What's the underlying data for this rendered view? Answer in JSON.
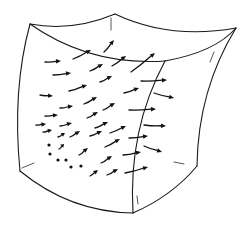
{
  "figure": {
    "title": "",
    "colors": {
      "background": "#ffffff",
      "ink": "#111111"
    }
  },
  "cube": {
    "vertices": {
      "top_left": [
        30,
        24
      ],
      "top_back": [
        115,
        14
      ],
      "top_right": [
        236,
        28
      ],
      "front_top": [
        165,
        61
      ],
      "bottom_left": [
        20,
        171
      ],
      "bottom_front": [
        133,
        213
      ],
      "bottom_right": [
        197,
        166
      ]
    },
    "edges": [
      {
        "name": "top-left-to-top-back",
        "d": "M30,24 Q72,32 115,14"
      },
      {
        "name": "top-back-to-top-right",
        "d": "M115,14 Q170,40 236,28"
      },
      {
        "name": "top-left-to-front-top",
        "d": "M30,24 Q90,66 165,61"
      },
      {
        "name": "front-top-to-top-right",
        "d": "M165,61 Q215,52 236,28"
      },
      {
        "name": "left-vertical",
        "d": "M30,24 Q12,90 20,171"
      },
      {
        "name": "front-vertical",
        "d": "M165,61 Q128,130 133,213"
      },
      {
        "name": "right-vertical",
        "d": "M236,28 Q198,90 197,166"
      },
      {
        "name": "bottom-left-to-bottom-front",
        "d": "M20,171 Q70,212 133,213"
      },
      {
        "name": "bottom-front-to-bottom-right",
        "d": "M133,213 Q172,196 197,166"
      }
    ],
    "hidden_edges": [
      {
        "name": "hidden-back-top",
        "d": "M111,18 L111,30"
      },
      {
        "name": "hidden-bottom-left",
        "d": "M22,168 L34,163"
      },
      {
        "name": "hidden-bottom-right",
        "d": "M174,162 L184,164"
      },
      {
        "name": "hidden-front-bottom",
        "d": "M137,196 L138,204"
      },
      {
        "name": "hidden-right-top",
        "d": "M214,52 L210,62"
      }
    ]
  },
  "vector_field": {
    "arrows": [
      {
        "from": [
          45,
          62
        ],
        "to": [
          61,
          61
        ]
      },
      {
        "from": [
          53,
          75
        ],
        "to": [
          71,
          73
        ]
      },
      {
        "from": [
          73,
          59
        ],
        "to": [
          91,
          50
        ]
      },
      {
        "from": [
          90,
          71
        ],
        "to": [
          103,
          64
        ]
      },
      {
        "from": [
          104,
          52
        ],
        "to": [
          114,
          40
        ]
      },
      {
        "from": [
          112,
          66
        ],
        "to": [
          126,
          56
        ]
      },
      {
        "from": [
          131,
          72
        ],
        "to": [
          155,
          53
        ]
      },
      {
        "from": [
          40,
          95
        ],
        "to": [
          53,
          96
        ]
      },
      {
        "from": [
          69,
          91
        ],
        "to": [
          87,
          85
        ]
      },
      {
        "from": [
          100,
          82
        ],
        "to": [
          112,
          76
        ]
      },
      {
        "from": [
          141,
          81
        ],
        "to": [
          167,
          80
        ]
      },
      {
        "from": [
          154,
          93
        ],
        "to": [
          174,
          98
        ]
      },
      {
        "from": [
          60,
          108
        ],
        "to": [
          73,
          106
        ]
      },
      {
        "from": [
          84,
          104
        ],
        "to": [
          97,
          97
        ]
      },
      {
        "from": [
          103,
          110
        ],
        "to": [
          115,
          103
        ]
      },
      {
        "from": [
          124,
          93
        ],
        "to": [
          139,
          88
        ]
      },
      {
        "from": [
          129,
          110
        ],
        "to": [
          156,
          109
        ]
      },
      {
        "from": [
          45,
          116
        ],
        "to": [
          58,
          115
        ]
      },
      {
        "from": [
          36,
          125
        ],
        "to": [
          46,
          124
        ]
      },
      {
        "from": [
          60,
          126
        ],
        "to": [
          72,
          123
        ]
      },
      {
        "from": [
          87,
          118
        ],
        "to": [
          98,
          112
        ]
      },
      {
        "from": [
          95,
          128
        ],
        "to": [
          108,
          122
        ]
      },
      {
        "from": [
          110,
          133
        ],
        "to": [
          126,
          126
        ]
      },
      {
        "from": [
          144,
          125
        ],
        "to": [
          166,
          126
        ]
      },
      {
        "from": [
          43,
          132
        ],
        "to": [
          52,
          130
        ]
      },
      {
        "from": [
          58,
          137
        ],
        "to": [
          65,
          133
        ]
      },
      {
        "from": [
          70,
          137
        ],
        "to": [
          80,
          131
        ]
      },
      {
        "from": [
          90,
          136
        ],
        "to": [
          102,
          131
        ]
      },
      {
        "from": [
          105,
          147
        ],
        "to": [
          120,
          139
        ]
      },
      {
        "from": [
          129,
          138
        ],
        "to": [
          148,
          136
        ]
      },
      {
        "from": [
          144,
          146
        ],
        "to": [
          162,
          152
        ]
      },
      {
        "from": [
          123,
          155
        ],
        "to": [
          141,
          152
        ]
      },
      {
        "from": [
          79,
          155
        ],
        "to": [
          88,
          148
        ]
      },
      {
        "from": [
          59,
          149
        ],
        "to": [
          64,
          144
        ]
      },
      {
        "from": [
          101,
          163
        ],
        "to": [
          112,
          156
        ]
      },
      {
        "from": [
          90,
          176
        ],
        "to": [
          98,
          170
        ]
      },
      {
        "from": [
          107,
          175
        ],
        "to": [
          118,
          169
        ]
      },
      {
        "from": [
          125,
          173
        ],
        "to": [
          148,
          167
        ]
      }
    ],
    "dots": [
      [
        49,
        145
      ],
      [
        50,
        154
      ],
      [
        58,
        160
      ],
      [
        66,
        160
      ],
      [
        71,
        167
      ],
      [
        81,
        166
      ]
    ]
  }
}
